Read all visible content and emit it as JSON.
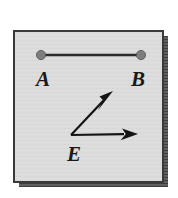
{
  "figure": {
    "panel": {
      "x": 14,
      "y": 31,
      "width": 149,
      "height": 151,
      "fill": "#dcdcdc",
      "border_color": "#3a3a3a",
      "border_width": 2,
      "shadow_color": "#4a4a4a"
    },
    "labels": {
      "a": "A",
      "b": "B",
      "e": "E"
    },
    "label_positions": {
      "a": {
        "x": 36,
        "y": 86
      },
      "b": {
        "x": 131,
        "y": 86
      },
      "e": {
        "x": 67,
        "y": 161
      }
    },
    "segment": {
      "name": "segment-ab",
      "x1": 41,
      "y1": 55,
      "x2": 141,
      "y2": 55,
      "stroke": "#2b2b2b",
      "stroke_width": 2.4
    },
    "endpoints": [
      {
        "name": "point-a",
        "cx": 41,
        "cy": 55,
        "r": 4.6,
        "fill": "#7d7d7d",
        "stroke": "#4f4f4f"
      },
      {
        "name": "point-b",
        "cx": 141,
        "cy": 55,
        "r": 4.6,
        "fill": "#7d7d7d",
        "stroke": "#4f4f4f"
      }
    ],
    "vertex": {
      "name": "vertex-e",
      "x": 71,
      "y": 135
    },
    "rays": [
      {
        "name": "ray-e-upper",
        "x1": 71,
        "y1": 135,
        "x2": 113,
        "y2": 91,
        "stroke": "#141414",
        "stroke_width": 2.2,
        "arrowhead": "filled-triangle"
      },
      {
        "name": "ray-e-lower",
        "x1": 71,
        "y1": 135,
        "x2": 138,
        "y2": 134,
        "stroke": "#141414",
        "stroke_width": 2.2,
        "arrowhead": "filled-triangle"
      }
    ],
    "colors": {
      "page_background": "#ffffff",
      "panel_fill": "#dcdcdc",
      "ink": "#1a1a1a"
    }
  }
}
